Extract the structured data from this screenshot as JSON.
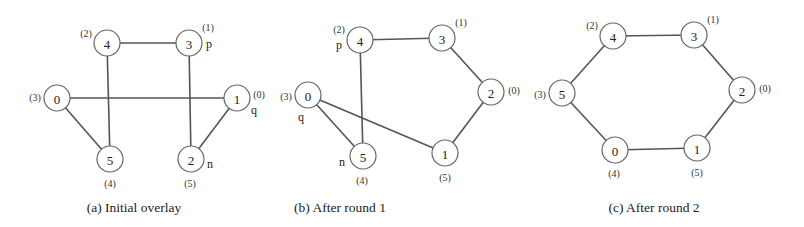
{
  "figure": {
    "panels": [
      {
        "id": "a",
        "caption": "(a) Initial overlay",
        "caption_pos": [
          134,
          207
        ],
        "nodes": [
          {
            "id": "0",
            "x": 57,
            "y": 98,
            "rank": "(3)",
            "rank_pos": [
              35,
              97
            ],
            "role": ""
          },
          {
            "id": "1",
            "x": 237,
            "y": 98,
            "rank": "(0)",
            "rank_pos": [
              259,
              94
            ],
            "role": "q",
            "role_pos": [
              254,
              110
            ]
          },
          {
            "id": "2",
            "x": 191,
            "y": 159,
            "rank": "(5)",
            "rank_pos": [
              190,
              183
            ],
            "role": "n",
            "role_pos": [
              210,
              164
            ]
          },
          {
            "id": "3",
            "x": 189,
            "y": 43,
            "rank": "(1)",
            "rank_pos": [
              208,
              27
            ],
            "role": "p",
            "role_pos": [
              209,
              44
            ]
          },
          {
            "id": "4",
            "x": 107,
            "y": 43,
            "rank": "(2)",
            "rank_pos": [
              86,
              33
            ],
            "role": ""
          },
          {
            "id": "5",
            "x": 110,
            "y": 159,
            "rank": "(4)",
            "rank_pos": [
              110,
              183
            ],
            "role": ""
          }
        ],
        "edges": [
          [
            "4",
            "3"
          ],
          [
            "0",
            "1"
          ],
          [
            "4",
            "5"
          ],
          [
            "3",
            "2"
          ],
          [
            "0",
            "5"
          ],
          [
            "1",
            "2"
          ]
        ]
      },
      {
        "id": "b",
        "caption": "(b) After round 1",
        "caption_pos": [
          340,
          207
        ],
        "nodes": [
          {
            "id": "0",
            "x": 308,
            "y": 95,
            "rank": "(3)",
            "rank_pos": [
              286,
              96
            ],
            "role": "q",
            "role_pos": [
              301,
              117
            ]
          },
          {
            "id": "1",
            "x": 445,
            "y": 153,
            "rank": "(5)",
            "rank_pos": [
              445,
              177
            ],
            "role": ""
          },
          {
            "id": "2",
            "x": 491,
            "y": 92,
            "rank": "(0)",
            "rank_pos": [
              514,
              90
            ],
            "role": ""
          },
          {
            "id": "3",
            "x": 442,
            "y": 38,
            "rank": "(1)",
            "rank_pos": [
              461,
              22
            ],
            "role": ""
          },
          {
            "id": "4",
            "x": 360,
            "y": 40,
            "rank": "(2)",
            "rank_pos": [
              339,
              29
            ],
            "role": "p",
            "role_pos": [
              339,
              45
            ]
          },
          {
            "id": "5",
            "x": 363,
            "y": 156,
            "rank": "(4)",
            "rank_pos": [
              362,
              180
            ],
            "role": "n",
            "role_pos": [
              342,
              162
            ]
          }
        ],
        "edges": [
          [
            "4",
            "3"
          ],
          [
            "3",
            "2"
          ],
          [
            "2",
            "1"
          ],
          [
            "4",
            "5"
          ],
          [
            "0",
            "5"
          ],
          [
            "0",
            "1"
          ]
        ]
      },
      {
        "id": "c",
        "caption": "(c) After round 2",
        "caption_pos": [
          654,
          207
        ],
        "nodes": [
          {
            "id": "0",
            "x": 615,
            "y": 150,
            "rank": "(4)",
            "rank_pos": [
              614,
              173
            ],
            "role": ""
          },
          {
            "id": "1",
            "x": 697,
            "y": 148,
            "rank": "(5)",
            "rank_pos": [
              697,
              172
            ],
            "role": ""
          },
          {
            "id": "2",
            "x": 742,
            "y": 90,
            "rank": "(0)",
            "rank_pos": [
              765,
              88
            ],
            "role": ""
          },
          {
            "id": "3",
            "x": 694,
            "y": 35,
            "rank": "(1)",
            "rank_pos": [
              713,
              19
            ],
            "role": ""
          },
          {
            "id": "4",
            "x": 613,
            "y": 36,
            "rank": "(2)",
            "rank_pos": [
              592,
              25
            ],
            "role": ""
          },
          {
            "id": "5",
            "x": 562,
            "y": 93,
            "rank": "(3)",
            "rank_pos": [
              540,
              94
            ],
            "role": ""
          }
        ],
        "edges": [
          [
            "4",
            "3"
          ],
          [
            "3",
            "2"
          ],
          [
            "2",
            "1"
          ],
          [
            "1",
            "0"
          ],
          [
            "0",
            "5"
          ],
          [
            "5",
            "4"
          ]
        ]
      }
    ],
    "node_radius": 13
  }
}
